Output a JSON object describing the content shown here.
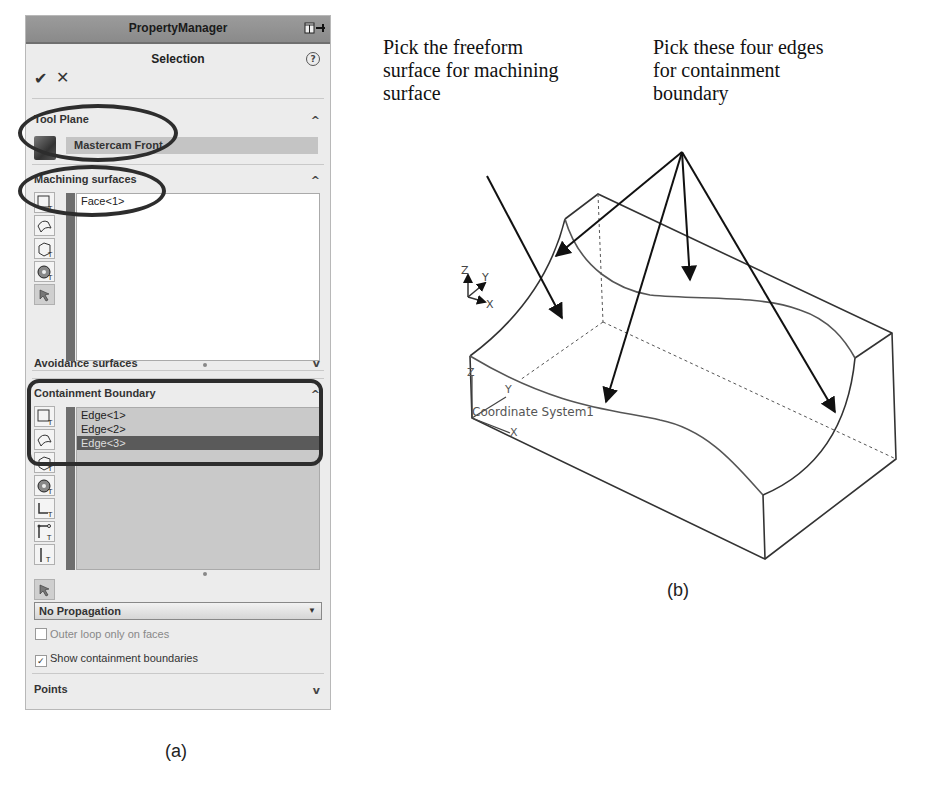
{
  "panel_a": {
    "titlebar": {
      "title": "PropertyManager",
      "icons": [
        "layout-icon",
        "pin-icon"
      ]
    },
    "header": {
      "title": "Selection",
      "help_icon": "?"
    },
    "actions": {
      "ok": "✔",
      "cancel": "✕"
    },
    "tool_plane": {
      "label": "Tool Plane",
      "value": "Mastercam Front",
      "expanded": true
    },
    "machining_surfaces": {
      "label": "Machining surfaces",
      "expanded": true,
      "items": [
        "Face<1>"
      ]
    },
    "avoidance_surfaces": {
      "label": "Avoidance surfaces",
      "expanded": false
    },
    "containment_boundary": {
      "label": "Containment Boundary",
      "expanded": true,
      "items": [
        "Edge<1>",
        "Edge<2>",
        "Edge<3>"
      ],
      "selected_index": 2,
      "propagation": "No Propagation",
      "outer_loop_label": "Outer loop only on faces",
      "outer_loop_checked": false,
      "show_boundaries_label": "Show containment boundaries",
      "show_boundaries_checked": true
    },
    "points": {
      "label": "Points",
      "expanded": false
    },
    "caption": "(a)"
  },
  "panel_b": {
    "note_left": [
      "Pick the freeform",
      "surface for machining",
      "surface"
    ],
    "note_right": [
      "Pick these four edges",
      "for containment",
      "boundary"
    ],
    "model_labels": {
      "triad": {
        "z": "Z",
        "y": "Y",
        "x": "X"
      },
      "coord_system": {
        "label": "Coordinate System1",
        "z": "Z",
        "y": "Y",
        "x": "X"
      }
    },
    "caption": "(b)"
  },
  "chevrons": {
    "up": "^",
    "down": "v"
  },
  "colors": {
    "panel_bg": "#ececec",
    "titlebar": "#8f8f8f",
    "selected_row": "#5a5a5a",
    "annotation_stroke": "#2d2d2d"
  }
}
